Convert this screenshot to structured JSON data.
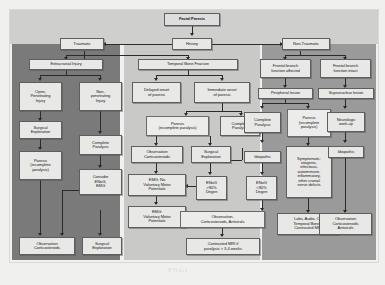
{
  "diagram": {
    "title": "Facial Paresis",
    "watermark": "PNGI",
    "colors": {
      "page_background": "#f0f0ee",
      "panel_dark": "#7a7a7a",
      "panel_mid": "#9a9a9a",
      "panel_light": "#c9c9c7",
      "node_fill": "#e8e8e6",
      "node_border": "#5e5e5e",
      "edge": "#2b2b2b"
    },
    "panels": [
      {
        "name": "extracranial-injury-panel",
        "tone": "dark"
      },
      {
        "name": "temporal-bone-fracture-panel",
        "tone": "light"
      },
      {
        "name": "non-traumatic-panel",
        "tone": "mid"
      }
    ],
    "nodes": {
      "root": "Facial Paresis",
      "history": "History",
      "traumatic": "Traumatic",
      "non_traumatic": "Non-Traumatic",
      "extracranial_injury": "Extracranial Injury",
      "open_penetrating": "Open,\nPenetrating\nInjury",
      "non_penetrating": "Non-\npenetrating\nInjury",
      "surgical_exploration_1": "Surgical\nExploration",
      "complete_paralysis_1": "Complete\nParalysis",
      "paresis_incomplete_1": "Paresis\n(incomplete\nparalysis)",
      "consider_enog_emg": "Consider\nENoG,\nEMG",
      "observation_cortico_1": "Observation\nCorticosteroids",
      "surgical_exploration_2": "Surgical\nExploration",
      "temporal_bone_fracture": "Temporal Bone Fracture",
      "delayed_onset": "Delayed onset\nof paresis",
      "immediate_onset": "Immediate onset\nof paresis",
      "paresis_incomplete_2": "Paresis\n(incomplete paralysis)",
      "complete_paralysis_2": "Complete\nParalysis",
      "observation_cortico_2": "Observation\nCorticosteroids",
      "surgical_exploration_3": "Surgical\nExploration",
      "emg_no_voluntary": "EMG: No\nVoluntary Motor\nPotentials",
      "emg_voluntary": "EMG:\nVoluntary Motor\nPotentials",
      "enog_high": "ENoG\n>90%\nDegen",
      "enog_low": "ENoG\n<90%\nDegen",
      "observation_cortico_antivirals_1": "Observation,\nCorticosteroids, Antivirals",
      "contrasted_mri": "Contrasted MRI if\nparalysis > 3-4 weeks",
      "frontal_affected": "Frontal branch\nfunction affected",
      "frontal_intact": "Frontal branch\nfunction intact",
      "peripheral_lesion": "Peripheral lesion",
      "supranuclear_lesion": "Supranuclear lesion",
      "complete_paralysis_3": "Complete\nParalysis",
      "paresis_incomplete_3": "Paresis\n(incomplete\nparalysis)",
      "neurologic_workup": "Neurologic\nwork-up",
      "idiopathic_1": "Idiopathic",
      "idiopathic_2": "Idiopathic",
      "symptomatic": "Symptomatic:\notogenic,\ninfectious,\nautoimmune,\ninflammatory,\nother cranial\nnerve deficits",
      "labs_audio_ct": "Labs, Audio, CT\nTemporal Bones,\nContrasted MRI",
      "observation_cortico_antivirals_2": "Observation\nCorticosteroids\nAntivirals"
    }
  }
}
